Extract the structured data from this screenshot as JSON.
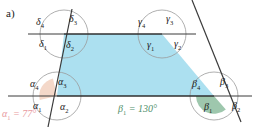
{
  "figure": {
    "part_label": "a)",
    "type": "geometry-diagram",
    "colors": {
      "interior_fill": "#ace0f0",
      "alpha1_fill": "#f4d8c9",
      "beta1_fill": "#9ec7ad",
      "line": "#3b3b3b",
      "arc": "#8a8a8a",
      "alpha_text": "#e89aa0",
      "beta_text": "#4f8f6a"
    },
    "vertices": [
      {
        "name": "delta-vertex",
        "symbol": "δ",
        "x": 64,
        "y": 34,
        "angles": [
          {
            "name": "delta-4",
            "sym": "δ",
            "sub": "4",
            "x": 36,
            "y": 17
          },
          {
            "name": "delta-3",
            "sym": "δ",
            "sub": "3",
            "x": 69,
            "y": 14
          },
          {
            "name": "delta-1",
            "sym": "δ",
            "sub": "1",
            "x": 39,
            "y": 39
          },
          {
            "name": "delta-2",
            "sym": "δ",
            "sub": "2",
            "x": 66,
            "y": 40
          }
        ]
      },
      {
        "name": "gamma-vertex",
        "symbol": "γ",
        "x": 162,
        "y": 34,
        "angles": [
          {
            "name": "gamma-4",
            "sym": "γ",
            "sub": "4",
            "x": 138,
            "y": 17
          },
          {
            "name": "gamma-3",
            "sym": "γ",
            "sub": "3",
            "x": 166,
            "y": 14
          },
          {
            "name": "gamma-1",
            "sym": "γ",
            "sub": "1",
            "x": 147,
            "y": 40
          },
          {
            "name": "gamma-2",
            "sym": "γ",
            "sub": "2",
            "x": 174,
            "y": 39
          }
        ]
      },
      {
        "name": "alpha-vertex",
        "symbol": "α",
        "x": 57,
        "y": 96,
        "angles": [
          {
            "name": "alpha-4",
            "sym": "α",
            "sub": "4",
            "x": 30,
            "y": 79
          },
          {
            "name": "alpha-3",
            "sym": "α",
            "sub": "3",
            "x": 58,
            "y": 77
          },
          {
            "name": "alpha-1",
            "sym": "α",
            "sub": "1",
            "x": 33,
            "y": 101
          },
          {
            "name": "alpha-2",
            "sym": "α",
            "sub": "2",
            "x": 60,
            "y": 102
          }
        ]
      },
      {
        "name": "beta-vertex",
        "symbol": "β",
        "x": 214,
        "y": 96,
        "angles": [
          {
            "name": "beta-4",
            "sym": "β",
            "sub": "4",
            "x": 192,
            "y": 79
          },
          {
            "name": "beta-3",
            "sym": "β",
            "sub": "3",
            "x": 220,
            "y": 77
          },
          {
            "name": "beta-1",
            "sym": "β",
            "sub": "1",
            "x": 204,
            "y": 102
          },
          {
            "name": "beta-2",
            "sym": "β",
            "sub": "2",
            "x": 232,
            "y": 101
          }
        ]
      }
    ],
    "annotations": [
      {
        "name": "alpha1-value",
        "sym": "α",
        "sub": "1",
        "text": " = 77°",
        "x": 2,
        "y": 109,
        "style": "eq-alpha"
      },
      {
        "name": "beta1-value",
        "sym": "β",
        "sub": "1",
        "text": " = 130°",
        "x": 118,
        "y": 104,
        "style": "eq-beta"
      }
    ]
  }
}
